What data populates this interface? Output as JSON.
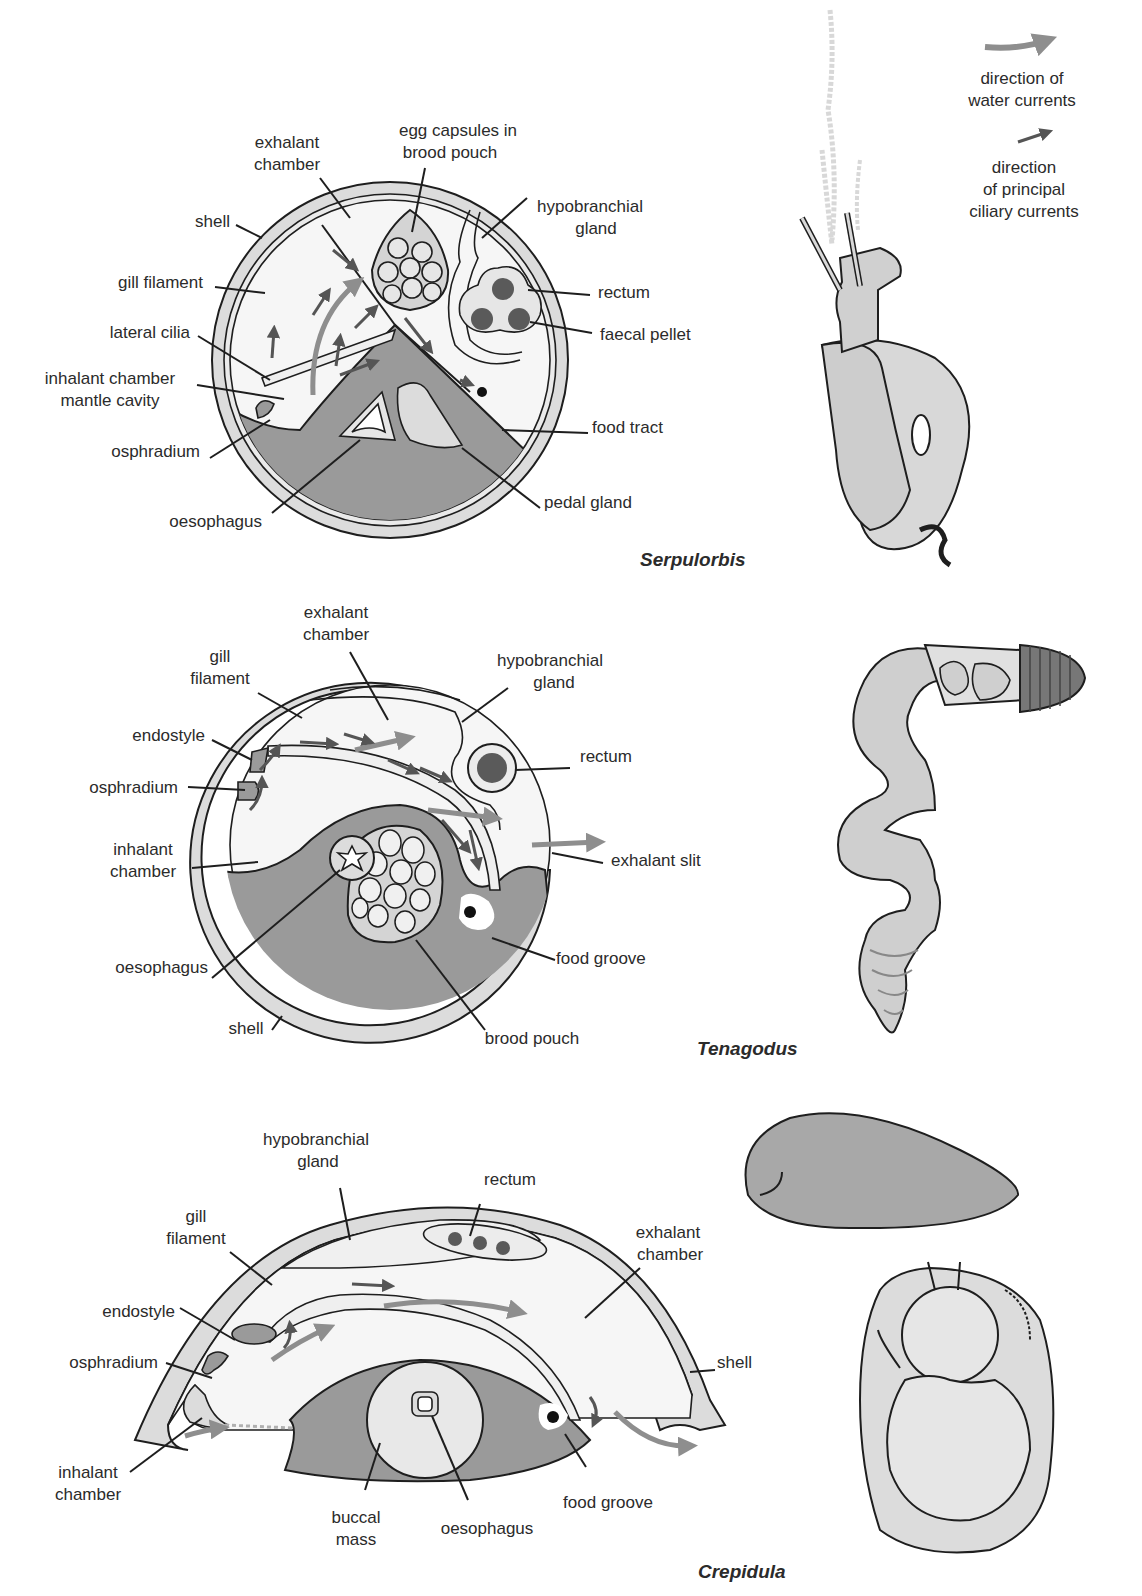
{
  "colors": {
    "shell": "#dcdcdc",
    "mantle": "#f4f4f4",
    "tissue": "#9a9a9a",
    "gland": "#d6d6d6",
    "pellet": "#5a5a5a",
    "water_arrow": "#8e8e8e",
    "ciliary_arrow": "#555555",
    "outline": "#1e1e1e",
    "text": "#2b2b2b"
  },
  "legend": {
    "water": [
      "direction of",
      "water currents"
    ],
    "ciliary": [
      "direction",
      "of principal",
      "ciliary currents"
    ]
  },
  "serpulorbis": {
    "species": "Serpulorbis",
    "labels": {
      "exhalant_chamber": [
        "exhalant",
        "chamber"
      ],
      "egg_capsules": [
        "egg capsules in",
        "brood pouch"
      ],
      "hypobranchial_gland": [
        "hypobranchial",
        "gland"
      ],
      "shell": "shell",
      "gill_filament": "gill filament",
      "lateral_cilia": "lateral cilia",
      "inhalant_chamber": [
        "inhalant chamber",
        "mantle cavity"
      ],
      "osphradium": "osphradium",
      "oesophagus": "oesophagus",
      "rectum": "rectum",
      "faecal_pellet": "faecal pellet",
      "food_tract": "food tract",
      "pedal_gland": "pedal gland"
    }
  },
  "tenagodus": {
    "species": "Tenagodus",
    "labels": {
      "exhalant_chamber": [
        "exhalant",
        "chamber"
      ],
      "gill_filament": [
        "gill",
        "filament"
      ],
      "hypobranchial_gland": [
        "hypobranchial",
        "gland"
      ],
      "endostyle": "endostyle",
      "osphradium": "osphradium",
      "rectum": "rectum",
      "inhalant_chamber": [
        "inhalant",
        "chamber"
      ],
      "exhalant_slit": "exhalant slit",
      "oesophagus": "oesophagus",
      "food_groove": "food groove",
      "shell": "shell",
      "brood_pouch": "brood pouch"
    }
  },
  "crepidula": {
    "species": "Crepidula",
    "labels": {
      "hypobranchial_gland": [
        "hypobranchial",
        "gland"
      ],
      "rectum": "rectum",
      "gill_filament": [
        "gill",
        "filament"
      ],
      "exhalant_chamber": [
        "exhalant",
        "chamber"
      ],
      "endostyle": "endostyle",
      "osphradium": "osphradium",
      "shell": "shell",
      "inhalant_chamber": [
        "inhalant",
        "chamber"
      ],
      "buccal_mass": [
        "buccal",
        "mass"
      ],
      "oesophagus": "oesophagus",
      "food_groove": "food groove"
    }
  }
}
